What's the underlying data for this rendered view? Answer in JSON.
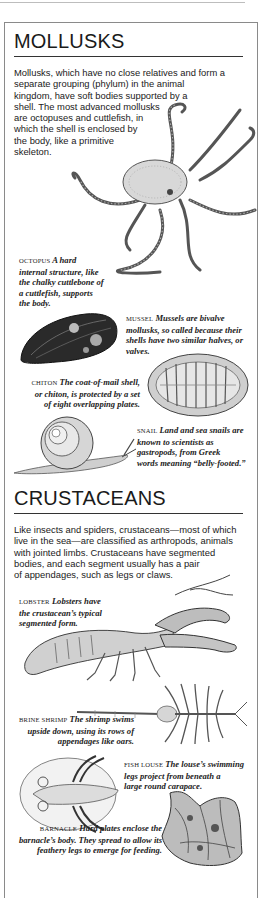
{
  "mollusks": {
    "heading": "MOLLUSKS",
    "intro_lines": [
      "Mollusks, which have no close relatives and form a",
      "separate grouping (phylum) in the animal",
      "kingdom, have soft bodies supported by a",
      "shell. The most advanced mollusks",
      "are octopuses and cuttlefish, in",
      "which the shell is enclosed by",
      "the body, like a primitive",
      "skeleton."
    ],
    "captions": {
      "octopus": {
        "label": "OCTOPUS",
        "lines": [
          "A hard",
          "internal structure, like",
          "the chalky cuttlebone of",
          "a cuttlefish, supports",
          "the body."
        ]
      },
      "mussel": {
        "label": "MUSSEL",
        "lines": [
          "Mussels are bivalve",
          "mollusks, so called because their",
          "shells have two similar halves, or",
          "valves."
        ]
      },
      "chiton": {
        "label": "CHITON",
        "lines": [
          "The coat-of-mail shell,",
          "or chiton, is protected by a set",
          "of eight overlapping plates."
        ]
      },
      "snail": {
        "label": "SNAIL",
        "lines": [
          "Land and sea snails are",
          "known to scientists as",
          "gastropods, from Greek",
          "words meaning “belly-footed.”"
        ]
      }
    }
  },
  "crustaceans": {
    "heading": "CRUSTACEANS",
    "intro_lines": [
      "Like insects and spiders, crustaceans—most of which",
      "live in the sea—are classified as arthropods, animals",
      "with jointed limbs. Crustaceans have segmented",
      "bodies, and each segment usually has a pair",
      "of appendages, such as legs or claws."
    ],
    "captions": {
      "lobster": {
        "label": "LOBSTER",
        "lines": [
          "Lobsters have",
          "the crustacean’s typical",
          "segmented form."
        ]
      },
      "brine_shrimp": {
        "label": "BRINE SHRIMP",
        "lines": [
          "The shrimp swims",
          "upside down, using its rows of",
          "appendages like oars."
        ]
      },
      "fish_louse": {
        "label": "FISH LOUSE",
        "lines": [
          "The louse’s swimming",
          "legs project from beneath a",
          "large round carapace."
        ]
      },
      "barnacle": {
        "label": "BARNACLE",
        "lines": [
          "Hard plates enclose the",
          "barnacle’s body. They spread to allow its",
          "feathery legs to emerge for feeding."
        ]
      }
    }
  }
}
